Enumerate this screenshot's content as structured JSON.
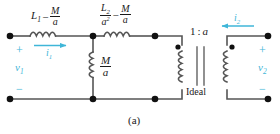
{
  "figure": {
    "caption": "(a)",
    "accent_color": "#3fb6d8",
    "wire_color": "#555555",
    "text_color": "#1a1a1a"
  },
  "components": {
    "inductor_series_1": {
      "name": "L1 minus M over a",
      "term1": "L",
      "term1_sub": "1",
      "operator": "−",
      "frac_num": "M",
      "frac_den": "a"
    },
    "inductor_series_2": {
      "name": "L2 over a squared minus M over a",
      "frac1_num": "L",
      "frac1_num_sub": "2",
      "frac1_den": "a",
      "frac1_den_sup": "2",
      "operator": "−",
      "frac2_num": "M",
      "frac2_den": "a"
    },
    "inductor_shunt": {
      "name": "M over a",
      "frac_num": "M",
      "frac_den": "a"
    },
    "transformer": {
      "ratio_left": "1",
      "ratio_colon": ":",
      "ratio_right": "a",
      "label": "Ideal"
    }
  },
  "terminals": {
    "left": {
      "plus": "+",
      "minus": "−",
      "voltage": "v",
      "voltage_sub": "1"
    },
    "right": {
      "plus": "+",
      "minus": "−",
      "voltage": "v",
      "voltage_sub": "2"
    }
  },
  "currents": {
    "i1": {
      "symbol": "i",
      "sub": "1",
      "direction": "right"
    },
    "i2": {
      "symbol": "i",
      "sub": "2",
      "direction": "left"
    }
  }
}
